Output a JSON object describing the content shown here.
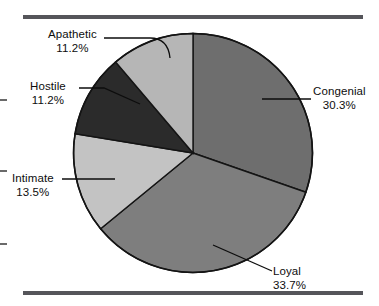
{
  "chart_data": {
    "type": "pie",
    "title": "",
    "subtitle": "",
    "xlabel": "",
    "ylabel": "",
    "legend_position": "none",
    "grid": false,
    "start_angle_deg": 0,
    "direction": "clockwise",
    "units": "percent",
    "categories": [
      "Congenial",
      "Loyal",
      "Intimate",
      "Hostile",
      "Apathetic"
    ],
    "values": [
      30.3,
      33.7,
      13.5,
      11.2,
      11.2
    ],
    "slices": [
      {
        "label": "Congenial",
        "value": 30.3,
        "value_text": "30.3%",
        "color": "#6e6e6e"
      },
      {
        "label": "Loyal",
        "value": 33.7,
        "value_text": "33.7%",
        "color": "#7e7e7e"
      },
      {
        "label": "Intimate",
        "value": 13.5,
        "value_text": "13.5%",
        "color": "#c3c3c3"
      },
      {
        "label": "Hostile",
        "value": 11.2,
        "value_text": "11.2%",
        "color": "#2b2b2b"
      },
      {
        "label": "Apathetic",
        "value": 11.2,
        "value_text": "11.2%",
        "color": "#b6b6b6"
      }
    ]
  },
  "labels": {
    "apathetic": {
      "name": "Apathetic",
      "pct": "11.2%"
    },
    "hostile": {
      "name": "Hostile",
      "pct": "11.2%"
    },
    "intimate": {
      "name": "Intimate",
      "pct": "13.5%"
    },
    "congenial": {
      "name": "Congenial",
      "pct": "30.3%"
    },
    "loyal": {
      "name": "Loyal",
      "pct": "33.7%"
    }
  },
  "colors": {
    "rule": "#55555a",
    "outline": "#141414",
    "background": "#ffffff",
    "text": "#0d0d0d"
  }
}
